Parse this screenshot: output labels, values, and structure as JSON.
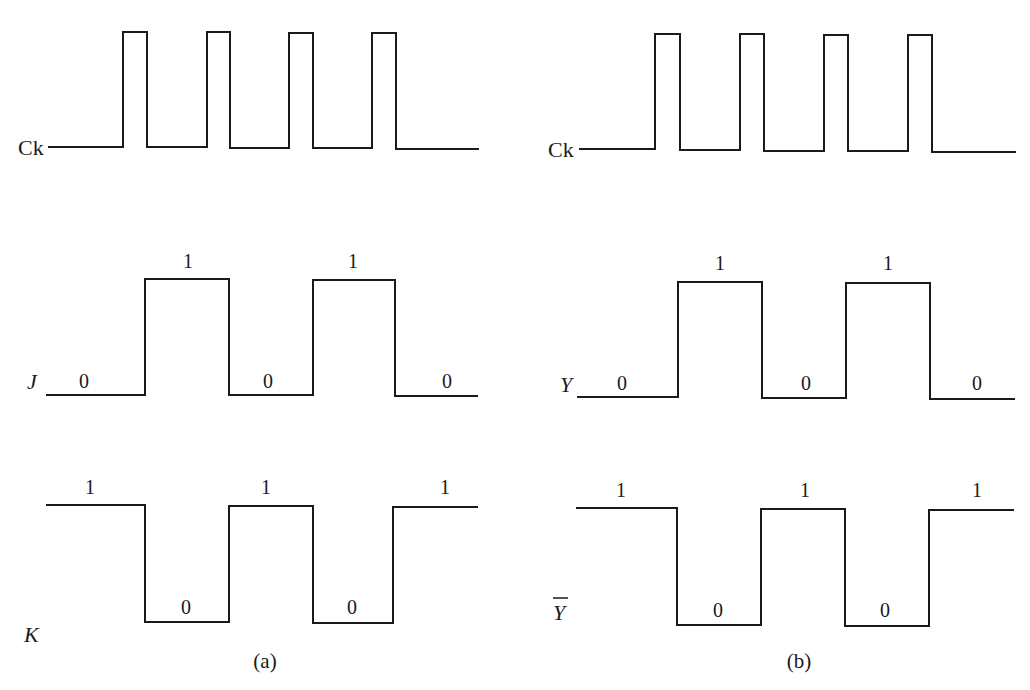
{
  "panels": [
    {
      "caption": "(a)",
      "signals": [
        {
          "name": "Ck",
          "italic": false,
          "overbar": false,
          "levels": [],
          "pulses": 4
        },
        {
          "name": "J",
          "italic": true,
          "overbar": false,
          "levels": [
            "0",
            "1",
            "0",
            "1",
            "0"
          ]
        },
        {
          "name": "K",
          "italic": true,
          "overbar": false,
          "levels": [
            "1",
            "0",
            "1",
            "0",
            "1"
          ]
        }
      ]
    },
    {
      "caption": "(b)",
      "signals": [
        {
          "name": "Ck",
          "italic": false,
          "overbar": false,
          "levels": [],
          "pulses": 4
        },
        {
          "name": "Y",
          "italic": true,
          "overbar": false,
          "levels": [
            "0",
            "1",
            "0",
            "1",
            "0"
          ]
        },
        {
          "name": "Y",
          "italic": true,
          "overbar": true,
          "levels": [
            "1",
            "0",
            "1",
            "0",
            "1"
          ]
        }
      ]
    }
  ]
}
